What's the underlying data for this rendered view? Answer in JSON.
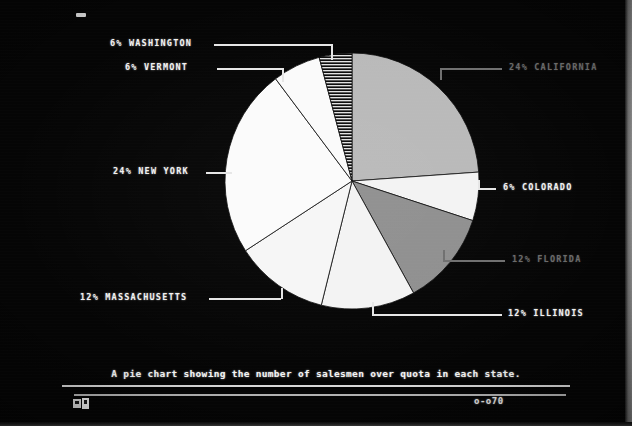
{
  "screen": {
    "background_color": "#050505",
    "top_marker": "-",
    "page_marker": "o-o70",
    "status_icon": "floppy-disk-icon"
  },
  "caption": {
    "text": "A pie chart showing the number of salesmen over quota in each state."
  },
  "chart_data": {
    "type": "pie",
    "title": "A pie chart showing the number of salesmen over quota in each state.",
    "categories": [
      "CALIFORNIA",
      "COLORADO",
      "FLORIDA",
      "ILLINOIS",
      "MASSACHUSETTS",
      "NEW YORK",
      "VERMONT",
      "WASHINGTON"
    ],
    "values": [
      24,
      6,
      12,
      12,
      12,
      24,
      6,
      6
    ],
    "unit": "%",
    "legend": "none",
    "labels_outside": true,
    "slices": [
      {
        "label": "24% CALIFORNIA",
        "name": "CALIFORNIA",
        "value": 24,
        "fill": "#b9b9b9",
        "pattern": "solid",
        "brightness": "dim",
        "start_deg": 0,
        "end_deg": 86
      },
      {
        "label": "6% COLORADO",
        "name": "COLORADO",
        "value": 6,
        "fill": "#f3f3f3",
        "pattern": "solid",
        "brightness": "bright",
        "start_deg": 86,
        "end_deg": 108
      },
      {
        "label": "12% FLORIDA",
        "name": "FLORIDA",
        "value": 12,
        "fill": "#8f8f8f",
        "pattern": "solid",
        "brightness": "dim",
        "start_deg": 108,
        "end_deg": 151
      },
      {
        "label": "12% ILLINOIS",
        "name": "ILLINOIS",
        "value": 12,
        "fill": "#f3f3f3",
        "pattern": "solid",
        "brightness": "bright",
        "start_deg": 151,
        "end_deg": 194
      },
      {
        "label": "12% MASSACHUSETTS",
        "name": "MASSACHUSETTS",
        "value": 12,
        "fill": "#f6f6f6",
        "pattern": "solid",
        "brightness": "bright",
        "start_deg": 194,
        "end_deg": 237
      },
      {
        "label": "24% NEW YORK",
        "name": "NEW YORK",
        "value": 24,
        "fill": "#fbfbfb",
        "pattern": "solid",
        "brightness": "bright",
        "start_deg": 237,
        "end_deg": 323
      },
      {
        "label": "6% VERMONT",
        "name": "VERMONT",
        "value": 6,
        "fill": "#fafafa",
        "pattern": "solid",
        "brightness": "bright",
        "start_deg": 323,
        "end_deg": 345
      },
      {
        "label": "6% WASHINGTON",
        "name": "WASHINGTON",
        "value": 6,
        "fill": "#d6d6d6",
        "pattern": "horizontal-hatch",
        "brightness": "bright",
        "start_deg": 345,
        "end_deg": 360
      }
    ],
    "colors": {
      "california": "#b9b9b9",
      "colorado": "#f3f3f3",
      "florida": "#8f8f8f",
      "illinois": "#f3f3f3",
      "massachusetts": "#f6f6f6",
      "new_york": "#fbfbfb",
      "vermont": "#fafafa",
      "washington": "#d6d6d6"
    }
  }
}
